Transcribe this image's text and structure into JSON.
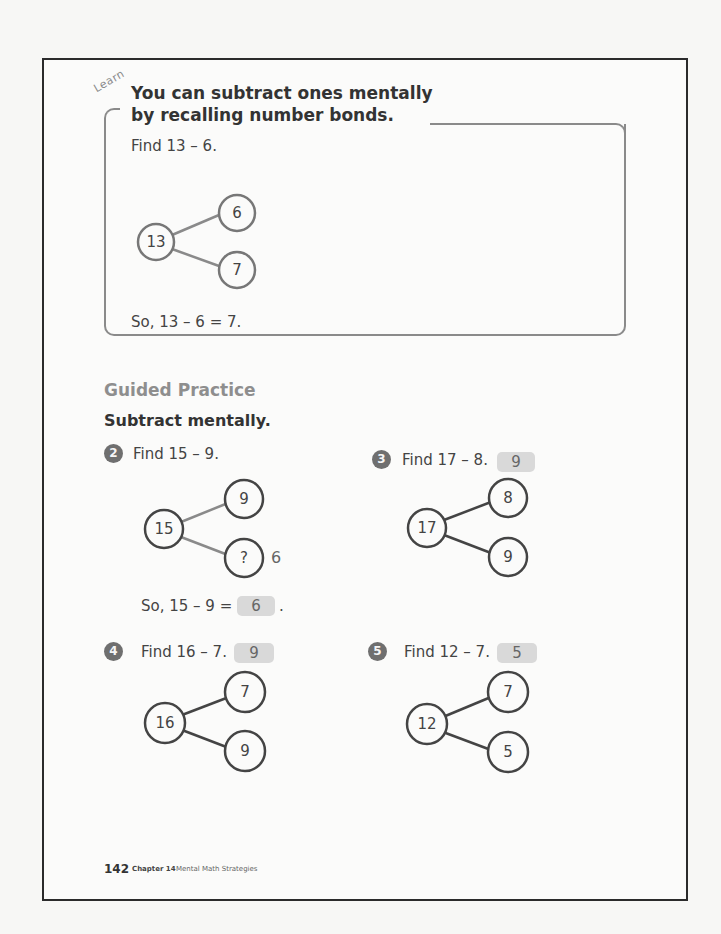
{
  "learn": {
    "label": "Learn",
    "title_line1": "You can subtract ones mentally",
    "title_line2": "by recalling number bonds.",
    "prompt": "Find 13 – 6.",
    "bond": {
      "whole": "13",
      "part_top": "6",
      "part_bottom": "7"
    },
    "conclusion": "So, 13 – 6 = 7."
  },
  "guided_practice": {
    "heading": "Guided Practice",
    "instruction": "Subtract mentally.",
    "problems": [
      {
        "number": "2",
        "prompt": "Find 15 – 9.",
        "bond": {
          "whole": "15",
          "part_top": "9",
          "part_bottom": "?"
        },
        "handwritten_side": "6",
        "conclusion_prefix": "So, 15 – 9 =",
        "answer": "6",
        "conclusion_suffix": "."
      },
      {
        "number": "3",
        "prompt": "Find 17 – 8.",
        "answer": "9",
        "bond": {
          "whole": "17",
          "part_top": "8",
          "part_bottom": "9"
        }
      },
      {
        "number": "4",
        "prompt": "Find 16 – 7.",
        "answer": "9",
        "bond": {
          "whole": "16",
          "part_top": "7",
          "part_bottom": "9"
        }
      },
      {
        "number": "5",
        "prompt": "Find 12 – 7.",
        "answer": "5",
        "bond": {
          "whole": "12",
          "part_top": "7",
          "part_bottom": "5"
        }
      }
    ]
  },
  "footer": {
    "page_number": "142",
    "chapter": "Chapter 14",
    "chapter_title": "Mental Math Strategies"
  },
  "colors": {
    "frame": "#2b2b2b",
    "learn_border": "#8a8a8a",
    "badge": "#6f6f6f",
    "answer_box": "#d9d9d9",
    "heading_gray": "#8e8e8e"
  }
}
